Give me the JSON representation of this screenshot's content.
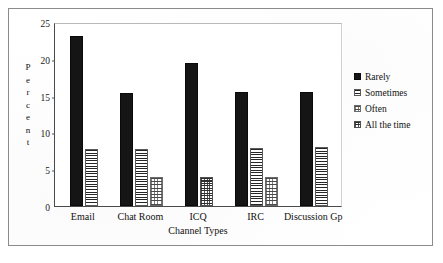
{
  "chart_data": {
    "type": "bar",
    "title": "",
    "xlabel": "Channel Types",
    "ylabel": "Percent",
    "ylim": [
      0,
      25
    ],
    "yticks": [
      0,
      5,
      10,
      15,
      20,
      25
    ],
    "grid": false,
    "legend_position": "right",
    "categories": [
      "Email",
      "Chat Room",
      "ICQ",
      "IRC",
      "Discussion Gp"
    ],
    "series": [
      {
        "name": "Rarely",
        "values": [
          23.1,
          15.4,
          19.4,
          15.5,
          15.5
        ]
      },
      {
        "name": "Sometimes",
        "values": [
          7.8,
          7.8,
          0,
          7.9,
          8.0
        ]
      },
      {
        "name": "Often",
        "values": [
          0,
          4.0,
          0,
          4.0,
          0
        ]
      },
      {
        "name": "All the time",
        "values": [
          0,
          0,
          4.0,
          0,
          0
        ]
      }
    ]
  },
  "ylabel_letters": [
    "P",
    "e",
    "r",
    "c",
    "e",
    "n",
    "t"
  ],
  "legend": {
    "items": [
      {
        "label": "Rarely",
        "pattern": "solid-black"
      },
      {
        "label": "Sometimes",
        "pattern": "horizontal-lines"
      },
      {
        "label": "Often",
        "pattern": "light-grid"
      },
      {
        "label": "All the time",
        "pattern": "dense-grid"
      }
    ]
  },
  "colors": {
    "bar_rarely": "#151515",
    "axis": "#4a4a4a",
    "frame": "#8b8b8b",
    "text": "#111111",
    "background": "#ffffff"
  }
}
